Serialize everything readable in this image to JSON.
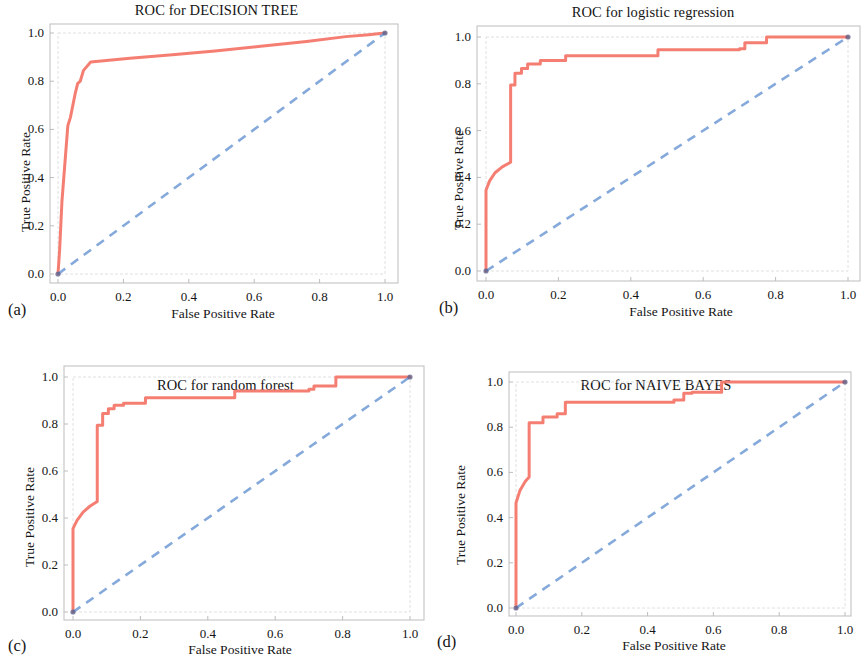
{
  "figure": {
    "background": "#ffffff",
    "roc_color": "#f4776b",
    "chance_color": "#6f9ad3",
    "axis_color": "#bdbdbd",
    "text_color": "#141414"
  },
  "panels": [
    {
      "key": "a",
      "subfig_label": "(a)",
      "title": "ROC for DECISION TREE",
      "xlabel": "False Positive Rate",
      "ylabel": "True Positive Rate",
      "xticks": [
        "0.0",
        "0.2",
        "0.4",
        "0.6",
        "0.8",
        "1.0"
      ],
      "yticks": [
        "0.0",
        "0.2",
        "0.4",
        "0.6",
        "0.8",
        "1.0"
      ]
    },
    {
      "key": "b",
      "subfig_label": "(b)",
      "title": "ROC for logistic regression",
      "xlabel": "False Positive Rate",
      "ylabel": "True Positive Rate",
      "xticks": [
        "0.0",
        "0.2",
        "0.4",
        "0.6",
        "0.8",
        "1.0"
      ],
      "yticks": [
        "0.0",
        "0.2",
        "0.4",
        "0.6",
        "0.8",
        "1.0"
      ]
    },
    {
      "key": "c",
      "subfig_label": "(c)",
      "title": "ROC for random forest",
      "xlabel": "False Positive Rate",
      "ylabel": "True Positive Rate",
      "xticks": [
        "0.0",
        "0.2",
        "0.4",
        "0.6",
        "0.8",
        "1.0"
      ],
      "yticks": [
        "0.0",
        "0.2",
        "0.4",
        "0.6",
        "0.8",
        "1.0"
      ]
    },
    {
      "key": "d",
      "subfig_label": "(d)",
      "title": "ROC for NAIVE BAYES",
      "xlabel": "False Positive Rate",
      "ylabel": "True Positive Rate",
      "xticks": [
        "0.0",
        "0.2",
        "0.4",
        "0.6",
        "0.8",
        "1.0"
      ],
      "yticks": [
        "0.0",
        "0.2",
        "0.4",
        "0.6",
        "0.8",
        "1.0"
      ]
    }
  ],
  "chart_data": [
    {
      "type": "line",
      "panel": "a",
      "title": "ROC for DECISION TREE",
      "xlabel": "False Positive Rate",
      "ylabel": "True Positive Rate",
      "xlim": [
        0.0,
        1.0
      ],
      "ylim": [
        0.0,
        1.0
      ],
      "grid": false,
      "legend": "none",
      "series": [
        {
          "name": "ROC curve",
          "style": "solid",
          "color": "#f4776b",
          "x": [
            0.0,
            0.005,
            0.012,
            0.03,
            0.038,
            0.052,
            0.06,
            0.068,
            0.078,
            0.1,
            0.14,
            0.22,
            0.35,
            0.48,
            0.62,
            0.76,
            0.88,
            0.95,
            0.985,
            1.0
          ],
          "y": [
            0.0,
            0.1,
            0.3,
            0.615,
            0.65,
            0.745,
            0.79,
            0.8,
            0.845,
            0.88,
            0.885,
            0.895,
            0.91,
            0.925,
            0.945,
            0.965,
            0.985,
            0.993,
            0.998,
            1.0
          ]
        },
        {
          "name": "chance",
          "style": "dashed",
          "color": "#6f9ad3",
          "x": [
            0.0,
            1.0
          ],
          "y": [
            0.0,
            1.0
          ]
        }
      ]
    },
    {
      "type": "line",
      "panel": "b",
      "title": "ROC for logistic regression",
      "xlabel": "False Positive Rate",
      "ylabel": "True Positive Rate",
      "xlim": [
        0.0,
        1.0
      ],
      "ylim": [
        0.0,
        1.0
      ],
      "grid": false,
      "legend": "none",
      "series": [
        {
          "name": "ROC curve",
          "style": "step",
          "color": "#f4776b",
          "x": [
            0.0,
            0.0,
            0.01,
            0.025,
            0.045,
            0.068,
            0.068,
            0.08,
            0.08,
            0.098,
            0.098,
            0.115,
            0.115,
            0.15,
            0.15,
            0.22,
            0.22,
            0.475,
            0.475,
            0.7,
            0.7,
            0.715,
            0.715,
            0.775,
            0.775,
            0.965,
            0.985,
            1.0
          ],
          "y": [
            0.0,
            0.345,
            0.385,
            0.42,
            0.445,
            0.465,
            0.795,
            0.795,
            0.845,
            0.845,
            0.865,
            0.865,
            0.885,
            0.885,
            0.9,
            0.9,
            0.92,
            0.92,
            0.945,
            0.945,
            0.95,
            0.95,
            0.975,
            0.975,
            1.0,
            1.0,
            1.0,
            1.0
          ]
        },
        {
          "name": "chance",
          "style": "dashed",
          "color": "#6f9ad3",
          "x": [
            0.0,
            1.0
          ],
          "y": [
            0.0,
            1.0
          ]
        }
      ]
    },
    {
      "type": "line",
      "panel": "c",
      "title": "ROC for random forest",
      "xlabel": "False Positive Rate",
      "ylabel": "True Positive Rate",
      "xlim": [
        0.0,
        1.0
      ],
      "ylim": [
        0.0,
        1.0
      ],
      "grid": false,
      "legend": "none",
      "series": [
        {
          "name": "ROC curve",
          "style": "step",
          "color": "#f4776b",
          "x": [
            0.0,
            0.0,
            0.012,
            0.03,
            0.05,
            0.072,
            0.072,
            0.088,
            0.088,
            0.105,
            0.105,
            0.122,
            0.122,
            0.15,
            0.15,
            0.215,
            0.215,
            0.48,
            0.48,
            0.7,
            0.7,
            0.715,
            0.715,
            0.78,
            0.78,
            0.975,
            1.0
          ],
          "y": [
            0.0,
            0.355,
            0.39,
            0.425,
            0.45,
            0.47,
            0.795,
            0.795,
            0.845,
            0.845,
            0.865,
            0.865,
            0.88,
            0.88,
            0.888,
            0.888,
            0.912,
            0.912,
            0.94,
            0.94,
            0.948,
            0.948,
            0.962,
            0.962,
            1.0,
            1.0,
            1.0
          ]
        },
        {
          "name": "chance",
          "style": "dashed",
          "color": "#6f9ad3",
          "x": [
            0.0,
            1.0
          ],
          "y": [
            0.0,
            1.0
          ]
        }
      ]
    },
    {
      "type": "line",
      "panel": "d",
      "title": "ROC for NAIVE BAYES",
      "xlabel": "False Positive Rate",
      "ylabel": "True Positive Rate",
      "xlim": [
        0.0,
        1.0
      ],
      "ylim": [
        0.0,
        1.0
      ],
      "grid": false,
      "legend": "none",
      "series": [
        {
          "name": "ROC curve",
          "style": "step",
          "color": "#f4776b",
          "x": [
            0.0,
            0.0,
            0.012,
            0.028,
            0.04,
            0.04,
            0.082,
            0.082,
            0.125,
            0.125,
            0.15,
            0.15,
            0.48,
            0.48,
            0.51,
            0.51,
            0.535,
            0.535,
            0.625,
            0.625,
            0.985,
            1.0
          ],
          "y": [
            0.0,
            0.465,
            0.52,
            0.56,
            0.58,
            0.82,
            0.82,
            0.845,
            0.845,
            0.86,
            0.86,
            0.91,
            0.91,
            0.92,
            0.92,
            0.95,
            0.95,
            0.955,
            0.955,
            1.0,
            1.0,
            1.0
          ]
        },
        {
          "name": "chance",
          "style": "dashed",
          "color": "#6f9ad3",
          "x": [
            0.0,
            1.0
          ],
          "y": [
            0.0,
            1.0
          ]
        }
      ]
    }
  ]
}
